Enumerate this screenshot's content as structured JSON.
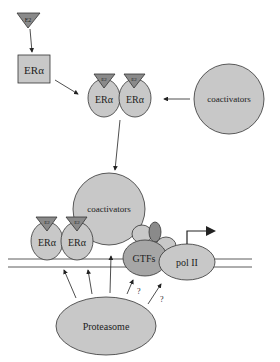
{
  "diagram": {
    "ligand_label": "E2",
    "receptor_label": "ERα",
    "coactivators_label": "coactivators",
    "gtfs_label": "GTFs",
    "pol_label": "pol II",
    "proteasome_label": "Proteasome",
    "question_mark": "?"
  },
  "colors": {
    "light_fill": "#c8c8c8",
    "mid_fill": "#a6a6a6",
    "dark_fill": "#7a7a7a",
    "stroke": "#333333",
    "background": "#ffffff"
  }
}
